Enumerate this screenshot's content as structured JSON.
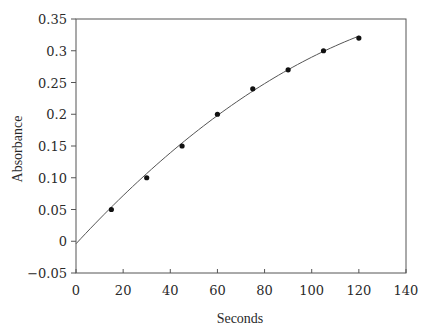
{
  "chart_data": {
    "type": "scatter",
    "title": "",
    "xlabel": "Seconds",
    "ylabel": "Absorbance",
    "xlim": [
      0,
      140
    ],
    "ylim": [
      -0.05,
      0.35
    ],
    "grid": false,
    "legend": null,
    "x_ticks": [
      0,
      20,
      40,
      60,
      80,
      100,
      120,
      140
    ],
    "x_tick_labels": [
      "0",
      "20",
      "40",
      "60",
      "80",
      "100",
      "120",
      "140"
    ],
    "y_ticks": [
      -0.05,
      0,
      0.05,
      0.1,
      0.15,
      0.2,
      0.25,
      0.3,
      0.35
    ],
    "y_tick_labels": [
      "−0.05",
      "0",
      "0.05",
      "0.10",
      "0.15",
      "0.2",
      "0.25",
      "0.3",
      "0.35"
    ],
    "series": [
      {
        "name": "Measured absorbance",
        "kind": "points",
        "x": [
          15,
          30,
          45,
          60,
          75,
          90,
          105,
          120
        ],
        "y": [
          0.05,
          0.1,
          0.15,
          0.2,
          0.24,
          0.27,
          0.3,
          0.32
        ]
      },
      {
        "name": "Fitted curve",
        "kind": "line",
        "model": "quadratic",
        "coefficients": {
          "a": -0.004,
          "b": 0.004008,
          "c": -1.069e-05
        },
        "x_range": [
          0,
          120
        ]
      }
    ]
  },
  "colors": {
    "axis": "#555555",
    "curve": "#555555",
    "points": "#111111",
    "text": "#2a2a2a"
  }
}
